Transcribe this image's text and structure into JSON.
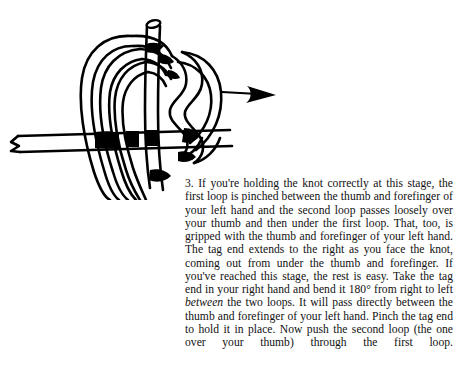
{
  "page": {
    "background_color": "#ffffff",
    "ink_color": "#000000"
  },
  "figure": {
    "elements": {
      "standing_end_label": "standing end entering from left",
      "cut_end_label": "cut rope end at top",
      "arrow_label": "direction arrow pointing right",
      "first_loop_label": "first loop",
      "second_loop_label": "second loop"
    }
  },
  "text": {
    "step_number": "3.",
    "paragraph_part_1": "3. If you're holding the knot correctly at this stage, the first loop is pinched between the thumb and forefinger of your left hand and the second loop passes loosely over your thumb and then under the first loop. That, too, is gripped with the thumb and forefinger of your left hand. The tag end extends to the right as you face the knot, coming out from under the thumb and forefinger. If you've reached this stage, the rest is easy. Take the tag end in your right hand and bend it 180° from right to left ",
    "paragraph_emphasis": "between",
    "paragraph_part_2": " the two loops. It will pass directly between the thumb and forefinger of your left hand. Pinch the tag end to hold it in place. Now push the second loop (the one over your thumb) through the first loop."
  }
}
